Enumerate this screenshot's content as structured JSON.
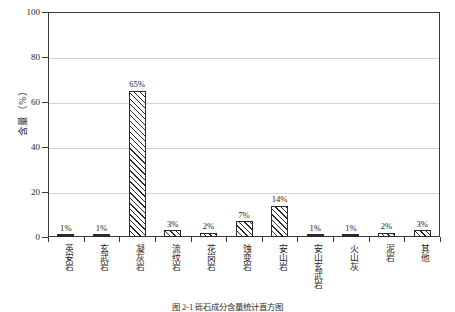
{
  "chart_data": {
    "type": "bar",
    "title": "",
    "xlabel": "",
    "ylabel": "含量（%）",
    "ylim": [
      0,
      100
    ],
    "yticks": [
      0,
      20,
      40,
      60,
      80,
      100
    ],
    "grid": true,
    "legend": "none",
    "categories": [
      "英安岩",
      "玄武岩",
      "凝灰岩",
      "流纹岩",
      "花岗岩",
      "蚀变岩",
      "安山岩",
      "安山玄武岩",
      "火山灰",
      "泥岩",
      "其他"
    ],
    "values": [
      1,
      1,
      65,
      3,
      2,
      7,
      14,
      1,
      1,
      2,
      3
    ],
    "data_labels": [
      "1%",
      "1%",
      "65%",
      "3%",
      "2%",
      "7%",
      "14%",
      "1%",
      "1%",
      "2%",
      "3%"
    ]
  },
  "caption": {
    "text": "图 2-1  砾石成分含量统计直方图"
  }
}
